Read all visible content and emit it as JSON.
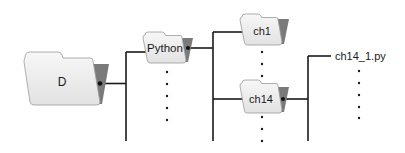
{
  "diagram": {
    "type": "directory-tree",
    "colors": {
      "folder_front": "#ededed",
      "folder_front_edge": "#9a9a9a",
      "folder_back": "#7a7a7a",
      "line": "#1a1a1a",
      "text": "#1a1a1a"
    },
    "nodes": [
      {
        "id": "root",
        "label": "D",
        "kind": "folder",
        "level": 0
      },
      {
        "id": "python",
        "label": "Python",
        "kind": "folder",
        "level": 1,
        "parent": "root"
      },
      {
        "id": "ch1",
        "label": "ch1",
        "kind": "folder",
        "level": 2,
        "parent": "python"
      },
      {
        "id": "ch14",
        "label": "ch14",
        "kind": "folder",
        "level": 2,
        "parent": "python"
      },
      {
        "id": "ch14_1",
        "label": "ch14_1.py",
        "kind": "file",
        "level": 3,
        "parent": "ch14"
      }
    ],
    "ellipses": [
      {
        "below": "python",
        "count": 5
      },
      {
        "below": "ch1",
        "count": 3
      },
      {
        "below": "ch14",
        "count": 3
      },
      {
        "below": "ch14_1",
        "count": 5
      }
    ]
  }
}
